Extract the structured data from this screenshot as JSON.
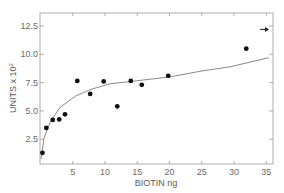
{
  "chart_data": {
    "type": "scatter",
    "title": "",
    "xlabel": "BIOTIN ng",
    "ylabel": "UNITS x 10",
    "ylabel_superscript": "2",
    "xlim": [
      0,
      36
    ],
    "ylim": [
      0,
      13.5
    ],
    "xticks": [
      5,
      10,
      15,
      20,
      25,
      30,
      35
    ],
    "yticks": [
      2.5,
      5.0,
      7.5,
      10.0,
      12.5
    ],
    "xtick_labels": [
      "5",
      "10",
      "15",
      "20",
      "25",
      "30",
      "35"
    ],
    "ytick_labels": [
      "2.5",
      "5.0",
      "7.5",
      "10.0",
      "12.5"
    ],
    "grid": false,
    "legend": null,
    "series": [
      {
        "name": "measured",
        "marker": "filled-circle",
        "x": [
          0.3,
          0.9,
          1.9,
          2.9,
          3.8,
          5.7,
          7.7,
          9.8,
          11.9,
          14.0,
          15.7,
          19.8,
          31.9
        ],
        "y": [
          1.3,
          3.5,
          4.2,
          4.25,
          4.7,
          7.65,
          6.5,
          7.6,
          5.4,
          7.65,
          7.3,
          8.1,
          10.5
        ]
      },
      {
        "name": "fitted-curve",
        "style": "line",
        "x": [
          0.1,
          0.55,
          1.5,
          3.0,
          5.4,
          7.8,
          10.8,
          14.0,
          17.0,
          20.1,
          24.7,
          29.4,
          35.4
        ],
        "y": [
          0.75,
          2.6,
          4.0,
          5.3,
          6.3,
          6.9,
          7.4,
          7.6,
          7.8,
          8.0,
          8.5,
          8.9,
          9.7
        ]
      }
    ],
    "annotations": [
      {
        "type": "arrow-right",
        "x": 34.8,
        "y": 12.2,
        "note": "off-scale value marker"
      }
    ]
  }
}
